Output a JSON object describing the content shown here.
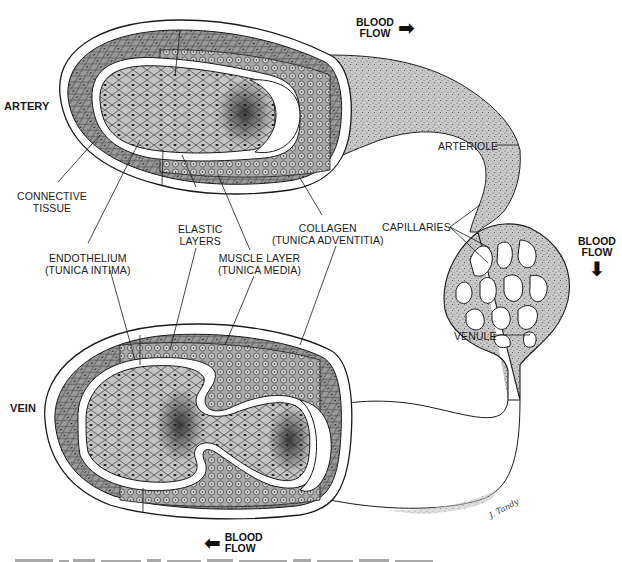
{
  "figure": {
    "vessels": {
      "artery": "ARTERY",
      "vein": "VEIN"
    },
    "labels": {
      "connective_tissue": [
        "CONNECTIVE",
        "TISSUE"
      ],
      "elastic_layers": [
        "ELASTIC",
        "LAYERS"
      ],
      "collagen": [
        "COLLAGEN",
        "(TUNICA ADVENTITIA)"
      ],
      "endothelium": [
        "ENDOTHELIUM",
        "(TUNICA INTIMA)"
      ],
      "muscle_layer": [
        "MUSCLE LAYER",
        "(TUNICA MEDIA)"
      ],
      "arteriole": "ARTERIOLE",
      "capillaries": "CAPILLARIES",
      "venule": "VENULE"
    },
    "blood_flow": [
      {
        "id": "top",
        "line1": "BLOOD",
        "line2": "FLOW",
        "direction": "right",
        "arrow": "➡"
      },
      {
        "id": "right",
        "line1": "BLOOD",
        "line2": "FLOW",
        "direction": "down",
        "arrow": "⬇"
      },
      {
        "id": "bottom",
        "line1": "BLOOD",
        "line2": "FLOW",
        "direction": "left",
        "arrow": "⬅"
      }
    ],
    "signature": "J. Tandy",
    "colors": {
      "ink": "#1a1a1a",
      "tissue_fill": "#bdbdbd",
      "tissue_dark": "#8c8c8c",
      "stipple": "#9e9e9e",
      "paper": "#ffffff"
    }
  }
}
